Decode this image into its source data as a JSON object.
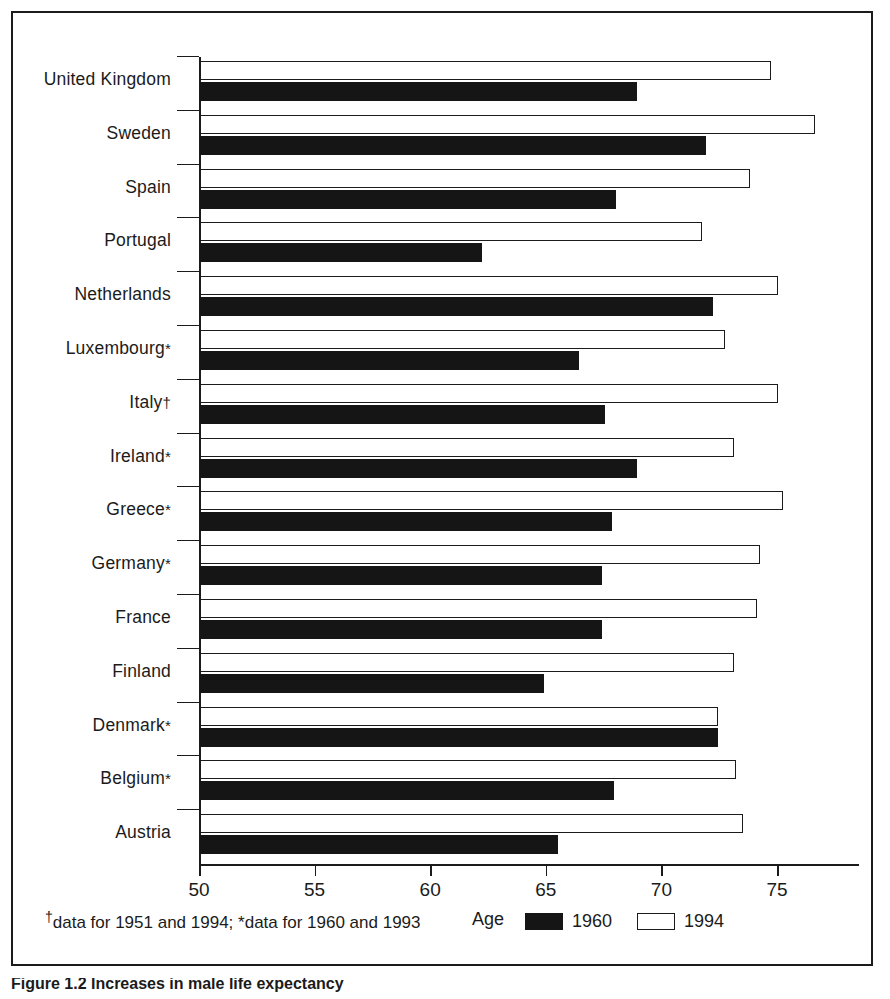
{
  "figure": {
    "caption": "Figure 1.2 Increases in male life expectancy"
  },
  "axis": {
    "x_title": "Age",
    "x_ticks": [
      "50",
      "55",
      "60",
      "65",
      "70",
      "75"
    ]
  },
  "legend": {
    "items": [
      {
        "label": "1960",
        "style": "filled-black"
      },
      {
        "label": "1994",
        "style": "outline-white"
      }
    ]
  },
  "footnote": {
    "dagger_symbol": "†",
    "text": "data for 1951 and 1994; *data for 1960 and 1993"
  },
  "chart_data": {
    "type": "bar",
    "orientation": "horizontal",
    "title": "",
    "xlabel": "Age",
    "ylabel": "",
    "xlim": [
      50,
      76.8
    ],
    "grid": false,
    "legend_position": "bottom-right",
    "categories": [
      "United Kingdom",
      "Sweden",
      "Spain",
      "Portugal",
      "Netherlands",
      "Luxembourg*",
      "Italy†",
      "Ireland*",
      "Greece*",
      "Germany*",
      "France",
      "Finland",
      "Denmark*",
      "Belgium*",
      "Austria"
    ],
    "series": [
      {
        "name": "1994",
        "values": [
          74.7,
          76.6,
          73.8,
          71.7,
          75.0,
          72.7,
          75.0,
          73.1,
          75.2,
          74.2,
          74.1,
          73.1,
          72.4,
          73.2,
          73.5
        ]
      },
      {
        "name": "1960",
        "values": [
          68.9,
          71.9,
          68.0,
          62.2,
          72.2,
          66.4,
          67.5,
          68.9,
          67.8,
          67.4,
          67.4,
          64.9,
          72.4,
          67.9,
          65.5
        ]
      }
    ]
  }
}
